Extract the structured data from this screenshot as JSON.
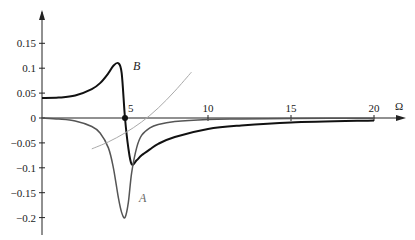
{
  "chart_data": {
    "type": "line",
    "title": "",
    "xlabel": "Ω",
    "ylabel": "",
    "xlim": [
      0,
      20.5
    ],
    "ylim": [
      -0.21,
      0.19
    ],
    "grid": false,
    "x_ticks": [
      5,
      10,
      15,
      20
    ],
    "x_tick_labels": [
      "5",
      "10",
      "15",
      "20"
    ],
    "y_ticks": [
      0.15,
      0.1,
      0.05,
      0,
      -0.05,
      -0.1,
      -0.15,
      -0.2
    ],
    "y_tick_labels": [
      "0.15",
      "0.1",
      "0.05",
      "0",
      "-0.05",
      "-0.1",
      "-0.15",
      "-0.2"
    ],
    "marker": {
      "x": 5,
      "y": 0,
      "label": "5"
    },
    "series": [
      {
        "name": "B",
        "color": "#111111",
        "x": [
          0,
          1,
          2,
          3,
          3.5,
          4,
          4.3,
          4.6,
          4.8,
          5.0,
          5.2,
          5.4,
          5.7,
          6,
          6.5,
          7,
          8,
          10,
          12,
          15,
          20
        ],
        "y": [
          0.04,
          0.041,
          0.045,
          0.058,
          0.07,
          0.09,
          0.105,
          0.11,
          0.09,
          0.0,
          -0.06,
          -0.093,
          -0.085,
          -0.075,
          -0.063,
          -0.052,
          -0.038,
          -0.022,
          -0.015,
          -0.009,
          -0.005
        ]
      },
      {
        "name": "A",
        "color": "#555555",
        "x": [
          0,
          1,
          2,
          3,
          3.5,
          4,
          4.3,
          4.6,
          4.8,
          5.0,
          5.2,
          5.4,
          5.7,
          6,
          6.5,
          7,
          8,
          10,
          12,
          15,
          20
        ],
        "y": [
          0.0,
          -0.002,
          -0.006,
          -0.017,
          -0.03,
          -0.06,
          -0.1,
          -0.16,
          -0.19,
          -0.2,
          -0.17,
          -0.11,
          -0.06,
          -0.035,
          -0.02,
          -0.013,
          -0.007,
          -0.003,
          -0.002,
          -0.001,
          -0.0005
        ]
      },
      {
        "name": "asymptote",
        "color": "#aaaaaa",
        "x": [
          3,
          4,
          5,
          6,
          7,
          8,
          9
        ],
        "y": [
          -0.062,
          -0.048,
          -0.03,
          -0.008,
          0.02,
          0.054,
          0.092
        ]
      }
    ],
    "annotations": [
      {
        "text": "B",
        "x": 5.0,
        "y": 0.105
      },
      {
        "text": "A",
        "x": 5.6,
        "y": -0.16
      }
    ]
  },
  "labels": {
    "x_axis": "Ω",
    "curve_b": "B",
    "curve_a": "A",
    "marker": "5"
  }
}
